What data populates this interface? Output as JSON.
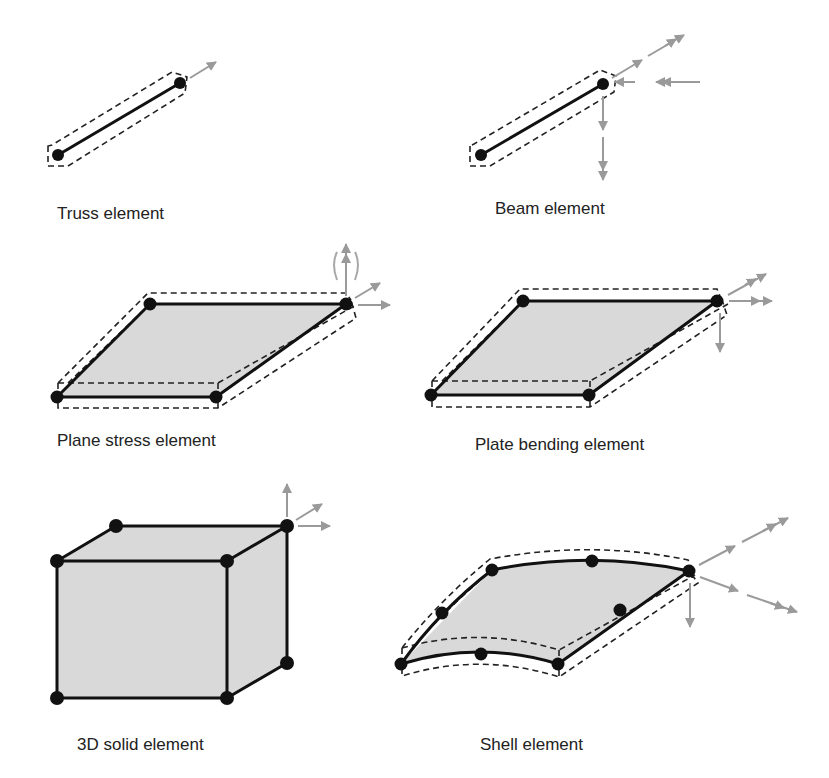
{
  "figure": {
    "elements": [
      {
        "id": "truss",
        "label": "Truss element"
      },
      {
        "id": "beam",
        "label": "Beam element"
      },
      {
        "id": "plane-stress",
        "label": "Plane stress element"
      },
      {
        "id": "plate-bending",
        "label": "Plate bending element"
      },
      {
        "id": "solid-3d",
        "label": "3D solid element"
      },
      {
        "id": "shell",
        "label": "Shell element"
      }
    ]
  },
  "colors": {
    "edge": "#111111",
    "face_fill": "#d9d9d9",
    "arrow": "#9a9a9a"
  }
}
